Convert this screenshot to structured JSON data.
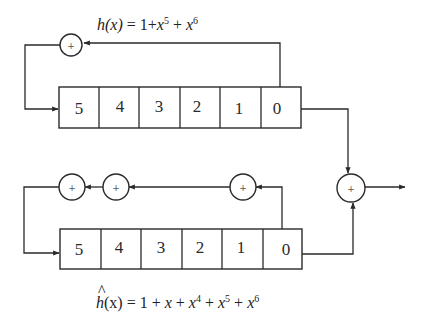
{
  "diagram": {
    "type": "shift-register-feedback",
    "top": {
      "equation_label": "h(x) = 1+x^5 + x^6",
      "eq_parts": {
        "h": "h(x)",
        "eq": " = 1+",
        "x1": "x",
        "e1": "5",
        "plus": " + ",
        "x2": "x",
        "e2": "6"
      },
      "cells": [
        "5",
        "4",
        "3",
        "2",
        "1",
        "0"
      ],
      "adders": [
        {
          "symbol": "+"
        }
      ]
    },
    "bottom": {
      "equation_label": "ĥ(x) = 1 + x + x^4 + x^5 + x^6",
      "eq_parts": {
        "hat": "^",
        "h": "h",
        "arg": "(x)",
        "eq": " = 1 + ",
        "x0": "x",
        "p0": " + ",
        "x1": "x",
        "e1": "4",
        "p1": " + ",
        "x2": "x",
        "e2": "5",
        "p2": " + ",
        "x3": "x",
        "e3": "6"
      },
      "cells": [
        "5",
        "4",
        "3",
        "2",
        "1",
        "0"
      ],
      "adders": [
        {
          "symbol": "+"
        },
        {
          "symbol": "+"
        },
        {
          "symbol": "+"
        }
      ]
    },
    "output_adder": {
      "symbol": "+"
    },
    "colors": {
      "line": "#2a2a2a",
      "background": "#ffffff"
    }
  }
}
